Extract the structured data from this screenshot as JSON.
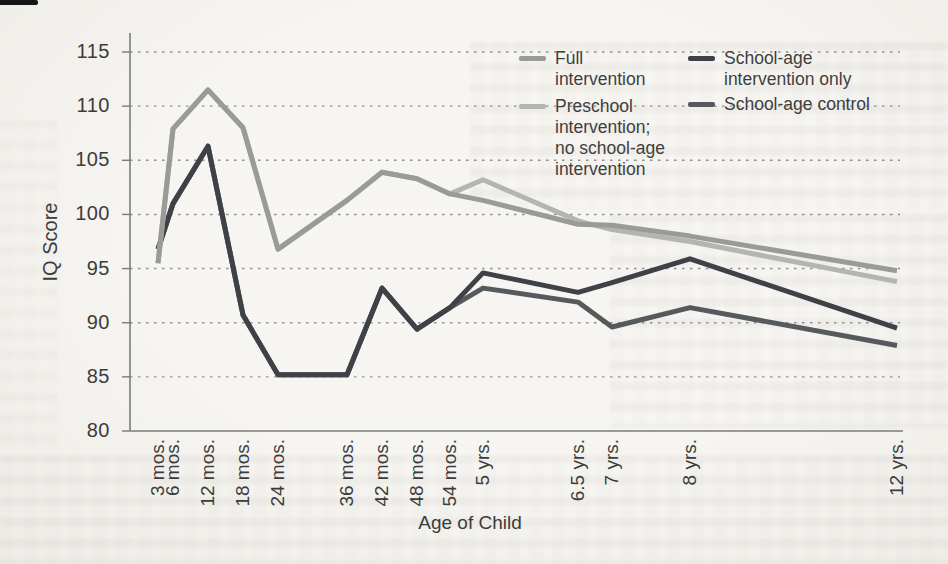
{
  "chart_data": {
    "type": "line",
    "title": "",
    "xlabel": "Age of Child",
    "ylabel": "IQ Score",
    "ylim": [
      80,
      115
    ],
    "yticks": [
      115,
      110,
      105,
      100,
      95,
      90,
      85,
      80
    ],
    "grid": "horizontal-dotted",
    "legend_position": "top-right-inside",
    "categories": [
      "3 mos.",
      "6 mos.",
      "12 mos.",
      "18 mos.",
      "24 mos.",
      "36 mos.",
      "42 mos.",
      "48 mos.",
      "54 mos.",
      "5 yrs.",
      "6.5 yrs.",
      "7 yrs.",
      "8 yrs.",
      "12 yrs."
    ],
    "x_months": [
      3,
      6,
      12,
      18,
      24,
      36,
      42,
      48,
      54,
      60,
      78,
      84,
      96,
      144
    ],
    "x_px": [
      158,
      173,
      208,
      243,
      278,
      347,
      382,
      417,
      450,
      483,
      578,
      612,
      690,
      897
    ],
    "series": [
      {
        "name": "Full intervention",
        "color": "#9a9a97",
        "values": [
          95.5,
          107.9,
          111.5,
          108.0,
          96.8,
          101.3,
          103.9,
          103.3,
          101.9,
          101.3,
          99.1,
          99.0,
          98.0,
          94.8
        ]
      },
      {
        "name": "Preschool intervention; no school-age intervention",
        "color": "#b4b4b1",
        "values": [
          95.5,
          107.9,
          111.5,
          108.0,
          96.8,
          101.3,
          103.9,
          103.3,
          101.9,
          103.2,
          99.4,
          98.6,
          97.5,
          93.8
        ]
      },
      {
        "name": "School-age intervention only",
        "color": "#3e4246",
        "values": [
          96.8,
          101.0,
          106.3,
          90.7,
          85.2,
          85.2,
          93.2,
          89.4,
          91.4,
          94.6,
          92.8,
          93.7,
          95.9,
          89.5
        ]
      },
      {
        "name": "School-age control",
        "color": "#565a5d",
        "values": [
          96.8,
          101.0,
          106.3,
          90.7,
          85.2,
          85.2,
          93.2,
          89.4,
          91.4,
          93.2,
          91.9,
          89.6,
          91.4,
          87.9
        ]
      }
    ]
  },
  "axes": {
    "y_title": "IQ Score",
    "x_title": "Age of Child"
  },
  "legend": {
    "items": [
      {
        "label": "Full\nintervention",
        "color": "#9a9a97"
      },
      {
        "label": "Preschool\nintervention;\nno school-age\nintervention",
        "color": "#b4b4b1"
      },
      {
        "label": "School-age\nintervention only",
        "color": "#3e4246"
      },
      {
        "label": "School-age control",
        "color": "#565a5d"
      }
    ]
  }
}
